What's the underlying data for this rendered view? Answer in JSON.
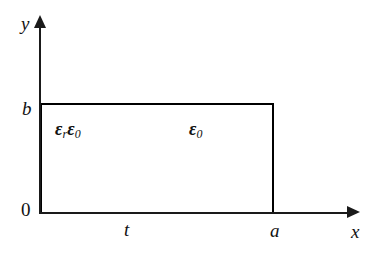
{
  "figure": {
    "background_color": "#ffffff",
    "line_color": "#000000",
    "shade_color": "#cfcfcf"
  },
  "axes": {
    "y": {
      "name": "y",
      "arrow": "up-arrow-icon"
    },
    "x": {
      "name": "x",
      "arrow": "right-arrow-icon"
    },
    "origin_label": "0"
  },
  "ticks": {
    "y_top": "b",
    "x_divider": "t",
    "x_right": "a"
  },
  "regions": [
    {
      "id": "dielectric",
      "symbol_greek": "ε",
      "symbol_sub_1": "r",
      "symbol_greek_2": "ε",
      "symbol_sub_2": "0",
      "fill": "shaded",
      "x_from": "0",
      "x_to": "t"
    },
    {
      "id": "air",
      "symbol_greek": "ε",
      "symbol_sub": "0",
      "fill": "white",
      "x_from": "t",
      "x_to": "a"
    }
  ]
}
